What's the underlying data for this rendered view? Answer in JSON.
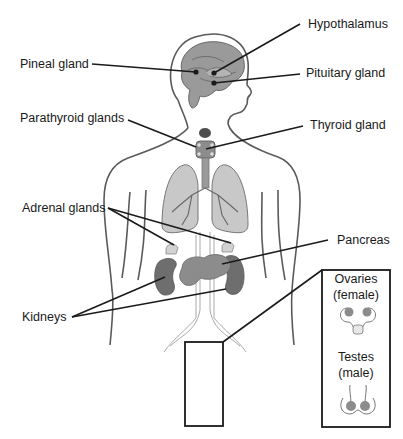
{
  "diagram": {
    "labels": {
      "hypothalamus": "Hypothalamus",
      "pineal": "Pineal gland",
      "pituitary": "Pituitary gland",
      "parathyroid": "Parathyroid glands",
      "thyroid": "Thyroid gland",
      "adrenal": "Adrenal glands",
      "pancreas": "Pancreas",
      "kidneys": "Kidneys"
    },
    "inset": {
      "ovaries_line1": "Ovaries",
      "ovaries_line2": "(female)",
      "testes_line1": "Testes",
      "testes_line2": "(male)"
    },
    "colors": {
      "outline": "#555555",
      "leader": "#1a1a1a",
      "brain": "#9a9a9a",
      "gland_dark": "#6e6e6e",
      "gland_mid": "#8c8c8c",
      "lung": "#c8c8c8",
      "adrenal": "#d2d2d2"
    }
  }
}
